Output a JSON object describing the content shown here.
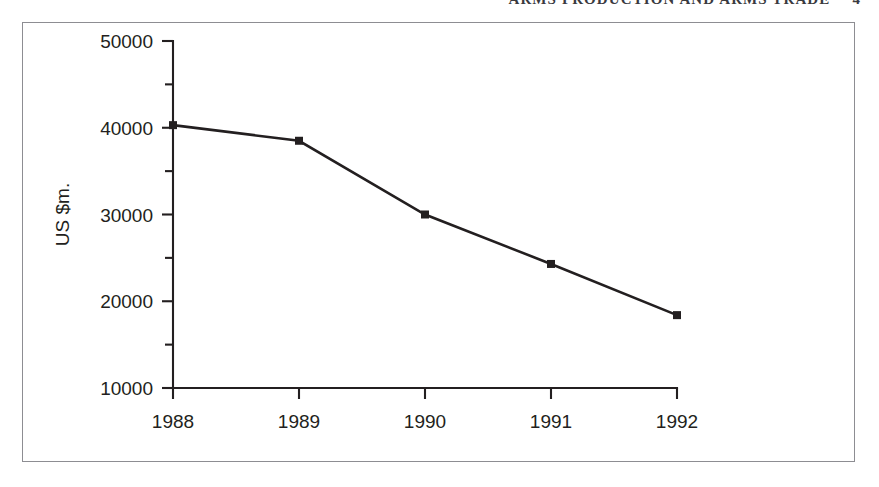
{
  "running_head": {
    "text": "ARMS PRODUCTION AND ARMS TRADE",
    "folio": "4"
  },
  "chart_data": {
    "type": "line",
    "title": "",
    "xlabel": "",
    "ylabel": "US $m.",
    "categories": [
      "1988",
      "1989",
      "1990",
      "1991",
      "1992"
    ],
    "x": [
      1988,
      1989,
      1990,
      1991,
      1992
    ],
    "values": [
      40300,
      38500,
      30000,
      24300,
      18400
    ],
    "series": [
      {
        "name": "US $m.",
        "values": [
          40300,
          38500,
          30000,
          24300,
          18400
        ]
      }
    ],
    "ylim": [
      10000,
      50000
    ],
    "ytick_labels": [
      "10000",
      "20000",
      "30000",
      "40000",
      "50000"
    ],
    "ytick_values": [
      10000,
      20000,
      30000,
      40000,
      50000
    ],
    "yminor_values": [
      15000,
      25000,
      35000,
      45000
    ],
    "xtick_labels": [
      "1988",
      "1989",
      "1990",
      "1991",
      "1992"
    ],
    "grid": false,
    "legend": false,
    "legend_position": "none",
    "marker": "filled-square",
    "line_color": "#231f20"
  },
  "colors": {
    "ink": "#231f20",
    "frame": "#8d8d92",
    "background": "#ffffff"
  }
}
